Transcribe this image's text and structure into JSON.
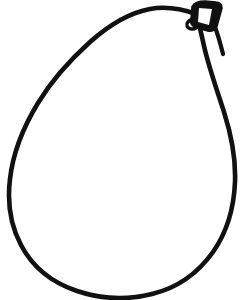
{
  "document": {
    "title": "Pear Outline Coloring Page",
    "subject": "pear",
    "style": "black line art, uncolored",
    "width": 251,
    "height": 300
  },
  "canvas": {
    "background_color": "#ffffff",
    "stroke_color": "#111111",
    "fill_color": "#ffffff"
  },
  "artwork": {
    "name": "pear",
    "parts": [
      {
        "id": "pear-body",
        "label": "Pear body outline",
        "stroke_width": 4.6,
        "fill": "#ffffff",
        "stroke": "#111111",
        "path": "M 196 14 C 182 9, 166 6, 150 9 C 128 13, 108 26, 90 42 C 70 60, 52 80, 38 103 C 24 126, 13 152, 10 179 C 7 203, 11 226, 21 245 C 33 268, 53 283, 77 291 C 101 299, 128 300, 152 294 C 177 288, 198 273, 213 252 C 227 232, 234 207, 235 182 C 236 158, 231 134, 224 112 C 217 90, 209 68, 204 46 C 201 33, 199 22, 196 14 Z"
      },
      {
        "id": "pear-stem-outer",
        "label": "Pear stem outer silhouette",
        "stroke_width": 3.6,
        "fill": "#111111",
        "stroke": "#111111",
        "path": "M 193 7 C 195 3, 200 2, 205 2 L 216 3 C 219 3, 221 5, 221 8 L 216 26 C 215 29, 212 31, 208 30 L 197 27 C 193 26, 191 23, 192 20 Z"
      },
      {
        "id": "pear-stem-inner",
        "label": "Pear stem white inner face",
        "stroke_width": 0,
        "fill": "#ffffff",
        "stroke": "none",
        "path": "M 199 8 L 212 9 L 209 25 L 198 22 Z"
      },
      {
        "id": "pear-stem-hook",
        "label": "Stem hook notch at lower left of stem",
        "stroke_width": 3.4,
        "fill": "none",
        "stroke": "#111111",
        "path": "M 193 19 C 189 20, 186 23, 187 26 C 188 29, 193 30, 196 28"
      },
      {
        "id": "pear-shoulder-right",
        "label": "Right shoulder connecting stem to body",
        "stroke_width": 4.2,
        "fill": "none",
        "stroke": "#111111",
        "path": "M 214 24 C 217 32, 220 42, 223 54"
      }
    ]
  },
  "colors": {
    "ink": "#111111",
    "paper": "#ffffff"
  }
}
